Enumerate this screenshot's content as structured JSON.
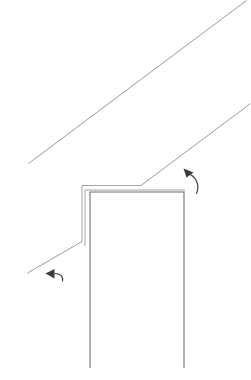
{
  "figure": {
    "title": "",
    "background_color": "#ffffff",
    "width": 251,
    "height": 380,
    "line_color": "#8d8d93",
    "body_line_color": "#6e6e74",
    "annotation_color": "#3a3a3e"
  },
  "geometry": {
    "upper_sloped_line": {
      "name": "upper-slope-line",
      "points": "28.5,163.5 246.5,0.5"
    },
    "lower_sloped_line": {
      "name": "lower-slope-line",
      "points": "141,185.5 250.5,103.5"
    },
    "left_sloped_line": {
      "name": "left-slope-line",
      "points": "27.5,273 82,241.5"
    },
    "outer_profile": {
      "name": "outer-profile-path",
      "points": "82,241.5 82,185.5 141,185.5"
    },
    "inner_profile": {
      "name": "inner-profile-path",
      "points": "85,246 85,190 185,190"
    },
    "body_outline": {
      "name": "body-outline-path",
      "points": "90,368 90,192 184,192 184,368"
    }
  },
  "annotations": {
    "upper_arrow": {
      "name": "upper-curved-leader-arrow",
      "curve": "M 196.5,193.5 C 199.5,187 197.5,179 190.5,174.5",
      "head_points": "183.5,168.5 193.5,172.5 186.5,177.5",
      "direction": "up-left"
    },
    "lower_arrow": {
      "name": "lower-curved-leader-arrow",
      "curve": "M 62.5,281 C 63.5,276.5 60.5,273.5 55,273.5",
      "head_points": "45.5,273.5 54.5,269 54.5,278.5",
      "direction": "left"
    }
  }
}
